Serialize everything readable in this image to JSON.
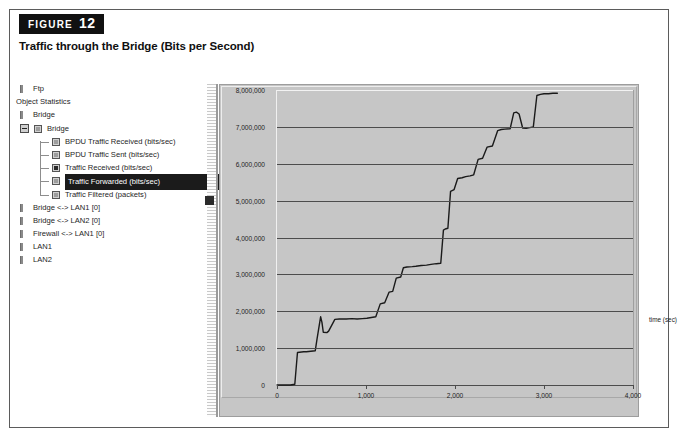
{
  "figure": {
    "tag_word": "FIGURE",
    "number": "12",
    "caption": "Traffic through the Bridge (Bits per Second)"
  },
  "tree": {
    "items": [
      {
        "label": "Ftp",
        "depth": 0,
        "icon": "bar-glyph",
        "selected": false
      },
      {
        "label": "Object Statistics",
        "depth": 0,
        "icon": "none",
        "selected": false
      },
      {
        "label": "Bridge",
        "depth": 0,
        "icon": "bar-glyph",
        "selected": false
      },
      {
        "label": "Bridge",
        "depth": 1,
        "icon": "node-box",
        "selected": false
      },
      {
        "label": "BPDU Traffic Received (bits/sec)",
        "depth": 2,
        "icon": "node-box",
        "selected": false
      },
      {
        "label": "BPDU Traffic Sent (bits/sec)",
        "depth": 2,
        "icon": "node-box",
        "selected": false
      },
      {
        "label": "Traffic Received (bits/sec)",
        "depth": 2,
        "icon": "node-box-checked",
        "selected": false
      },
      {
        "label": "Traffic Forwarded (bits/sec)",
        "depth": 2,
        "icon": "node-box",
        "selected": true
      },
      {
        "label": "Traffic Filtered (packets)",
        "depth": 2,
        "icon": "node-box",
        "selected": false
      },
      {
        "label": "Bridge <-> LAN1 [0]",
        "depth": 0,
        "icon": "bar-glyph",
        "selected": false
      },
      {
        "label": "Bridge <-> LAN2 [0]",
        "depth": 0,
        "icon": "bar-glyph",
        "selected": false
      },
      {
        "label": "Firewall <-> LAN1 [0]",
        "depth": 0,
        "icon": "bar-glyph",
        "selected": false
      },
      {
        "label": "LAN1",
        "depth": 0,
        "icon": "bar-glyph",
        "selected": false
      },
      {
        "label": "LAN2",
        "depth": 0,
        "icon": "bar-glyph",
        "selected": false
      }
    ]
  },
  "colors": {
    "panel_bg": "#c6c6c6",
    "grid": "#4c4c4c",
    "line": "#1a1a1a",
    "selection": "#1b1b1b"
  },
  "chart_data": {
    "type": "line",
    "title": "Traffic through the Bridge (Bits per Second)",
    "xlabel": "time (sec)",
    "ylabel": "",
    "xlim": [
      0,
      4000
    ],
    "ylim": [
      0,
      8000000
    ],
    "grid": true,
    "legend": null,
    "xticks": [
      0,
      1000,
      2000,
      3000,
      4000
    ],
    "xticklabels": [
      "0",
      "1,000",
      "2,000",
      "3,000",
      "4,000"
    ],
    "yticks": [
      0,
      1000000,
      2000000,
      3000000,
      4000000,
      5000000,
      6000000,
      7000000,
      8000000
    ],
    "yticklabels": [
      "0",
      "1,000,000",
      "2,000,000",
      "3,000,000",
      "4,000,000",
      "5,000,000",
      "6,000,000",
      "7,000,000",
      "8,000,000"
    ],
    "series": [
      {
        "name": "Traffic Forwarded (bits/sec)",
        "x": [
          0,
          110,
          150,
          200,
          230,
          300,
          330,
          430,
          450,
          490,
          505,
          520,
          560,
          580,
          650,
          700,
          780,
          840,
          900,
          960,
          1010,
          1060,
          1110,
          1160,
          1210,
          1260,
          1300,
          1340,
          1390,
          1420,
          1460,
          1520,
          1560,
          1620,
          1680,
          1730,
          1790,
          1840,
          1870,
          1890,
          1920,
          1950,
          1990,
          2030,
          2080,
          2120,
          2170,
          2210,
          2260,
          2310,
          2360,
          2420,
          2480,
          2520,
          2560,
          2620,
          2660,
          2690,
          2720,
          2760,
          2800,
          2840,
          2880,
          2920,
          2960,
          3000,
          3050,
          3100,
          3150
        ],
        "y": [
          0,
          0,
          0,
          20000,
          880000,
          900000,
          900000,
          930000,
          1250000,
          1850000,
          1700000,
          1430000,
          1420000,
          1460000,
          1780000,
          1790000,
          1790000,
          1800000,
          1790000,
          1800000,
          1810000,
          1830000,
          1850000,
          2200000,
          2230000,
          2520000,
          2540000,
          2900000,
          2930000,
          3180000,
          3200000,
          3210000,
          3220000,
          3240000,
          3250000,
          3270000,
          3290000,
          3300000,
          4200000,
          4230000,
          4250000,
          5250000,
          5300000,
          5600000,
          5620000,
          5650000,
          5670000,
          5700000,
          6120000,
          6150000,
          6450000,
          6480000,
          6900000,
          6930000,
          6940000,
          6950000,
          7380000,
          7400000,
          7350000,
          6970000,
          6960000,
          6980000,
          7000000,
          7850000,
          7880000,
          7900000,
          7900000,
          7910000,
          7910000
        ]
      }
    ]
  }
}
